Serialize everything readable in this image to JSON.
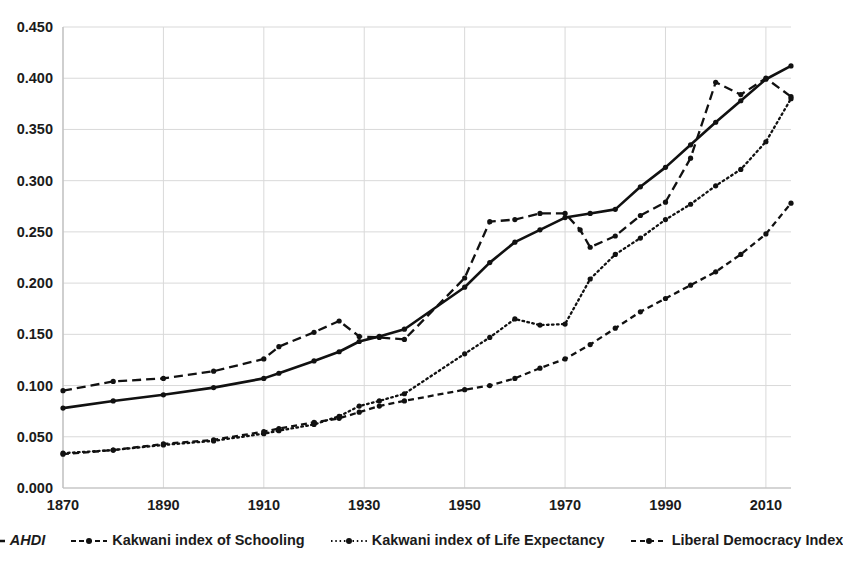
{
  "chart_data": {
    "type": "line",
    "title": "",
    "xlabel": "",
    "ylabel": "",
    "xlim": [
      1870,
      2015
    ],
    "ylim": [
      0.0,
      0.45
    ],
    "grid": true,
    "legend_position": "bottom",
    "ytick_labels": [
      "0.000",
      "0.050",
      "0.100",
      "0.150",
      "0.200",
      "0.250",
      "0.300",
      "0.350",
      "0.400",
      "0.450"
    ],
    "ytick_values": [
      0.0,
      0.05,
      0.1,
      0.15,
      0.2,
      0.25,
      0.3,
      0.35,
      0.4,
      0.45
    ],
    "xtick_labels": [
      "1870",
      "1890",
      "1910",
      "1930",
      "1950",
      "1970",
      "1990",
      "2010"
    ],
    "xtick_values": [
      1870,
      1890,
      1910,
      1930,
      1950,
      1970,
      1990,
      2010
    ],
    "series": [
      {
        "name": "AHDI",
        "style": "solid",
        "color": "#111111",
        "x": [
          1870,
          1880,
          1890,
          1900,
          1910,
          1913,
          1920,
          1925,
          1929,
          1933,
          1938,
          1950,
          1955,
          1960,
          1965,
          1970,
          1975,
          1980,
          1985,
          1990,
          1995,
          2000,
          2005,
          2010,
          2015
        ],
        "values": [
          0.078,
          0.085,
          0.091,
          0.098,
          0.107,
          0.112,
          0.124,
          0.133,
          0.143,
          0.148,
          0.155,
          0.196,
          0.22,
          0.24,
          0.252,
          0.264,
          0.268,
          0.272,
          0.294,
          0.313,
          0.335,
          0.357,
          0.378,
          0.399,
          0.412
        ]
      },
      {
        "name": "Kakwani index of Schooling",
        "style": "dashed",
        "color": "#111111",
        "x": [
          1870,
          1880,
          1890,
          1900,
          1910,
          1913,
          1920,
          1925,
          1929,
          1933,
          1938,
          1950,
          1955,
          1960,
          1965,
          1970,
          1973,
          1975,
          1980,
          1985,
          1990,
          1995,
          2000,
          2005,
          2010,
          2015
        ],
        "values": [
          0.095,
          0.104,
          0.107,
          0.114,
          0.126,
          0.138,
          0.152,
          0.163,
          0.148,
          0.147,
          0.145,
          0.205,
          0.26,
          0.262,
          0.268,
          0.268,
          0.252,
          0.235,
          0.246,
          0.266,
          0.279,
          0.322,
          0.396,
          0.384,
          0.4,
          0.382
        ]
      },
      {
        "name": "Kakwani index of Life Expectancy",
        "style": "dotted",
        "color": "#111111",
        "x": [
          1870,
          1880,
          1890,
          1900,
          1910,
          1913,
          1920,
          1925,
          1929,
          1933,
          1938,
          1950,
          1955,
          1960,
          1965,
          1970,
          1975,
          1980,
          1985,
          1990,
          1995,
          2000,
          2005,
          2010,
          2015
        ],
        "values": [
          0.034,
          0.037,
          0.042,
          0.046,
          0.053,
          0.056,
          0.062,
          0.07,
          0.08,
          0.085,
          0.092,
          0.131,
          0.147,
          0.165,
          0.159,
          0.16,
          0.204,
          0.228,
          0.244,
          0.262,
          0.277,
          0.295,
          0.311,
          0.338,
          0.38
        ]
      },
      {
        "name": "Liberal Democracy Index",
        "style": "dashdot",
        "color": "#111111",
        "x": [
          1870,
          1880,
          1890,
          1900,
          1910,
          1913,
          1920,
          1925,
          1929,
          1933,
          1938,
          1950,
          1955,
          1960,
          1965,
          1970,
          1975,
          1980,
          1985,
          1990,
          1995,
          2000,
          2005,
          2010,
          2015
        ],
        "values": [
          0.033,
          0.037,
          0.043,
          0.047,
          0.055,
          0.058,
          0.064,
          0.068,
          0.074,
          0.08,
          0.085,
          0.096,
          0.1,
          0.107,
          0.117,
          0.126,
          0.14,
          0.156,
          0.172,
          0.185,
          0.198,
          0.211,
          0.228,
          0.248,
          0.278
        ]
      }
    ]
  },
  "legend": {
    "items": [
      {
        "label": "AHDI",
        "style": "solid",
        "italic": true
      },
      {
        "label": "Kakwani index of Schooling",
        "style": "dashed",
        "italic": false
      },
      {
        "label": "Kakwani index of Life Expectancy",
        "style": "dotted",
        "italic": false
      },
      {
        "label": "Liberal Democracy Index",
        "style": "dashdot",
        "italic": false
      }
    ]
  }
}
